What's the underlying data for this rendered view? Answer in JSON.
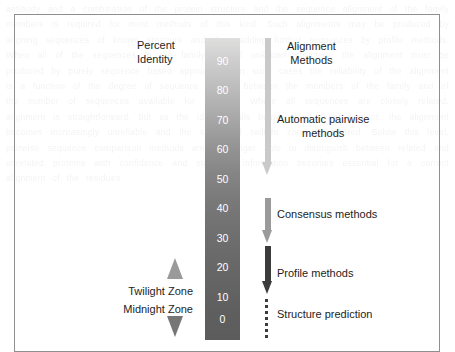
{
  "figure": {
    "scale_title_line1": "Percent",
    "scale_title_line2": "Identity",
    "methods_title_line1": "Alignment",
    "methods_title_line2": "Methods"
  },
  "scale": {
    "min": 0,
    "max": 100,
    "unit": "percent identity",
    "gradient_top_color": "#dedede",
    "gradient_bottom_color": "#5c5c5c",
    "tick_labels": [
      "100",
      "90",
      "80",
      "70",
      "60",
      "50",
      "40",
      "30",
      "20",
      "10",
      "0"
    ]
  },
  "methods": [
    {
      "id": "automatic-pairwise",
      "label_line1": "Automatic pairwise",
      "label_line2": "methods",
      "arrow_color": "#c9c9c9",
      "range_percent": [
        55,
        100
      ]
    },
    {
      "id": "consensus",
      "label_line1": "Consensus methods",
      "label_line2": "",
      "arrow_color": "#9a9a9a",
      "range_percent": [
        40,
        53
      ]
    },
    {
      "id": "profile",
      "label_line1": "Profile methods",
      "label_line2": "",
      "arrow_color": "#3b3b3b",
      "range_percent": [
        22,
        38
      ]
    },
    {
      "id": "structure-prediction",
      "label_line1": "Structure prediction",
      "label_line2": "",
      "arrow_color": "#3b3b3b",
      "range_percent": [
        0,
        18
      ]
    }
  ],
  "zones": [
    {
      "id": "twilight",
      "label": "Twilight Zone",
      "marker": "up-triangle",
      "marker_color": "#9a9a9a"
    },
    {
      "id": "midnight",
      "label": "Midnight Zone",
      "marker": "down-triangle",
      "marker_color": "#767676"
    }
  ],
  "background_bleed_text": "antibody and a combination of the protein structure and the sequence alignment of the family members is required for most methods of this kind. Such alignments may be produced by aligning sequences of known structure and then adding further sequences by profile methods. When all of the sequences in the family are of unknown structure, the alignment must be produced by purely sequence based approaches. In such cases the reliability of the alignment is a function of the degree of sequence identity between the members of the family and of the number of sequences available for analysis. Where all sequences are closely related, alignment is straightforward, but as the identity falls below about thirty percent, the alignment becomes increasingly unreliable and the so called twilight zone is entered. Below this level, pairwise sequence comparison methods are no longer able to distinguish between related and unrelated proteins with confidence and structural information becomes essential for a correct alignment of the residues."
}
